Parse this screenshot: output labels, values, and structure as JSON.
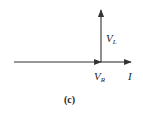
{
  "diagram": {
    "type": "phasor",
    "caption": "(c)",
    "colors": {
      "line": "#333333",
      "background": "#ffffff"
    },
    "phasors": [
      {
        "id": "V_R",
        "label_main": "V",
        "label_sub": "R",
        "direction": "horizontal-right",
        "from": [
          14,
          62
        ],
        "to": [
          101,
          62
        ]
      },
      {
        "id": "I",
        "label_main": "I",
        "label_sub": "",
        "direction": "horizontal-right",
        "from": [
          101,
          62
        ],
        "to": [
          131,
          62
        ]
      },
      {
        "id": "V_L",
        "label_main": "V",
        "label_sub": "L",
        "direction": "vertical-up",
        "from": [
          101,
          62
        ],
        "to": [
          101,
          10
        ]
      }
    ]
  }
}
